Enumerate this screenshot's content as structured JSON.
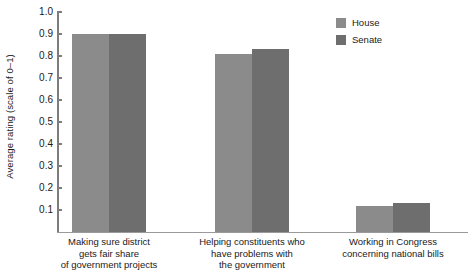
{
  "chart_data": {
    "type": "bar",
    "title": "",
    "xlabel": "",
    "ylabel": "Average rating (scale of 0–1)",
    "ylim": [
      0,
      1.0
    ],
    "ytick_labels": [
      "1.0",
      "0.9",
      "0.8",
      "0.7",
      "0.6",
      "0.5",
      "0.4",
      "0.3",
      "0.2",
      "0.1"
    ],
    "ytick_values": [
      1.0,
      0.9,
      0.8,
      0.7,
      0.6,
      0.5,
      0.4,
      0.3,
      0.2,
      0.1
    ],
    "grid": false,
    "legend_position": "top-right",
    "categories": [
      "Making sure district gets fair share of government projects",
      "Helping constituents who have problems with the government",
      "Working in Congress concerning national bills"
    ],
    "category_label_lines": [
      [
        "Making sure district",
        "gets fair share",
        "of government projects"
      ],
      [
        "Helping constituents who",
        "have problems with",
        "the government"
      ],
      [
        "Working in Congress",
        "concerning national bills"
      ]
    ],
    "series": [
      {
        "name": "House",
        "color": "#8b8b8b",
        "values": [
          0.9,
          0.81,
          0.12
        ]
      },
      {
        "name": "Senate",
        "color": "#6e6e6e",
        "values": [
          0.9,
          0.83,
          0.13
        ]
      }
    ]
  },
  "legend": {
    "items": [
      {
        "label": "House",
        "color": "#8b8b8b"
      },
      {
        "label": "Senate",
        "color": "#6e6e6e"
      }
    ]
  }
}
